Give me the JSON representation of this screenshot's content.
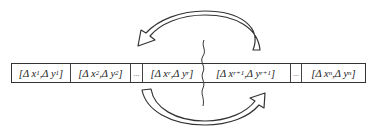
{
  "diagram": {
    "cells": [
      {
        "label": "[Δ x",
        "sx": "1",
        "mid": ",Δ y",
        "sy": "1",
        "end": "]"
      },
      {
        "label": "[Δ x",
        "sx": "2",
        "mid": ",Δ y",
        "sy": "2",
        "end": "]"
      },
      {
        "ellipsis": "..."
      },
      {
        "label": "[Δ x",
        "sx": "r",
        "mid": ",Δ y",
        "sy": "r",
        "end": "]"
      },
      {
        "label": "[Δ x",
        "sx": "r+1",
        "mid": ",Δ y",
        "sy": "r+1",
        "end": "]"
      },
      {
        "ellipsis": "..."
      },
      {
        "label": "[Δ x",
        "sx": "n",
        "mid": ",Δ y",
        "sy": "n",
        "end": "]"
      }
    ],
    "arrows": [
      {
        "name": "top-arrow",
        "direction": "right-to-left"
      },
      {
        "name": "bottom-arrow",
        "direction": "left-to-right"
      }
    ],
    "split_marker": "wavy-cut-line",
    "colors": {
      "stroke": "#333333",
      "fill": "#ffffff"
    }
  }
}
